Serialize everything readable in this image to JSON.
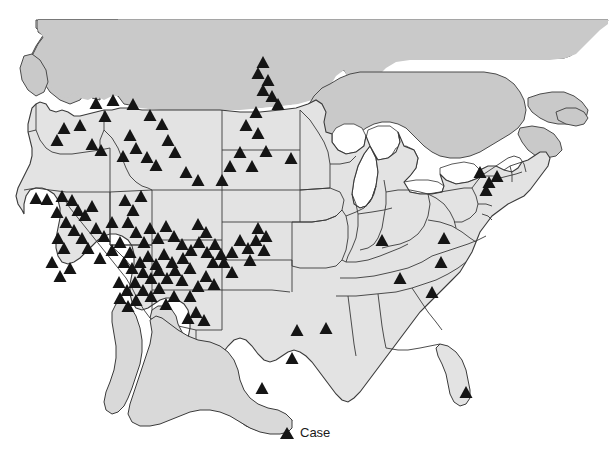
{
  "figure": {
    "title": "",
    "type": "choropleth-point-map",
    "region": "United States (contiguous) with southern Canada and northern Mexico"
  },
  "legend": {
    "marker_icon": "triangle-marker-icon",
    "label": "Case",
    "marker_color": "#151515"
  },
  "colors": {
    "us_fill": "#e3e3e3",
    "canada_fill": "#c9c9c9",
    "mexico_fill": "#d9d9d9",
    "border_stroke": "#3a3a3a",
    "water": "#ffffff",
    "marker": "#151515",
    "background": "#ffffff"
  },
  "map_data": {
    "type": "point-map",
    "marker_symbol": "triangle",
    "marker_size_px": 13,
    "total_markers": 152,
    "clusters": [
      {
        "name": "Pacific Northwest (WA/OR/ID)",
        "count": 14
      },
      {
        "name": "Sierra Nevada / CA-NV border",
        "count": 26
      },
      {
        "name": "Montana / Wyoming",
        "count": 10
      },
      {
        "name": "Dakotas diagonal",
        "count": 7
      },
      {
        "name": "Four Corners (CO/NM/UT/AZ)",
        "count": 52
      },
      {
        "name": "Texas / Gulf Coast",
        "count": 6
      },
      {
        "name": "Midwest / Ohio Valley",
        "count": 4
      },
      {
        "name": "Northeast corridor (NY/CT/NJ)",
        "count": 4
      },
      {
        "name": "Southeast (NC/FL)",
        "count": 2
      }
    ],
    "markers": [
      [
        263,
        62
      ],
      [
        258,
        73
      ],
      [
        268,
        80
      ],
      [
        263,
        90
      ],
      [
        272,
        96
      ],
      [
        278,
        104
      ],
      [
        256,
        112
      ],
      [
        96,
        103
      ],
      [
        113,
        100
      ],
      [
        133,
        104
      ],
      [
        150,
        115
      ],
      [
        162,
        124
      ],
      [
        105,
        116
      ],
      [
        80,
        125
      ],
      [
        64,
        128
      ],
      [
        57,
        140
      ],
      [
        92,
        144
      ],
      [
        101,
        150
      ],
      [
        130,
        135
      ],
      [
        136,
        148
      ],
      [
        168,
        140
      ],
      [
        123,
        156
      ],
      [
        147,
        157
      ],
      [
        156,
        165
      ],
      [
        175,
        152
      ],
      [
        246,
        125
      ],
      [
        258,
        133
      ],
      [
        240,
        152
      ],
      [
        266,
        151
      ],
      [
        252,
        166
      ],
      [
        291,
        158
      ],
      [
        230,
        166
      ],
      [
        222,
        180
      ],
      [
        186,
        172
      ],
      [
        198,
        180
      ],
      [
        36,
        198
      ],
      [
        47,
        199
      ],
      [
        62,
        196
      ],
      [
        72,
        200
      ],
      [
        78,
        210
      ],
      [
        85,
        215
      ],
      [
        92,
        206
      ],
      [
        57,
        212
      ],
      [
        66,
        222
      ],
      [
        74,
        230
      ],
      [
        82,
        238
      ],
      [
        96,
        228
      ],
      [
        104,
        236
      ],
      [
        112,
        222
      ],
      [
        88,
        248
      ],
      [
        100,
        258
      ],
      [
        58,
        238
      ],
      [
        64,
        248
      ],
      [
        52,
        262
      ],
      [
        70,
        268
      ],
      [
        60,
        276
      ],
      [
        125,
        200
      ],
      [
        133,
        210
      ],
      [
        141,
        196
      ],
      [
        128,
        222
      ],
      [
        136,
        232
      ],
      [
        144,
        242
      ],
      [
        120,
        242
      ],
      [
        112,
        250
      ],
      [
        130,
        252
      ],
      [
        150,
        228
      ],
      [
        158,
        238
      ],
      [
        166,
        226
      ],
      [
        174,
        236
      ],
      [
        182,
        244
      ],
      [
        140,
        262
      ],
      [
        148,
        256
      ],
      [
        156,
        264
      ],
      [
        132,
        268
      ],
      [
        124,
        262
      ],
      [
        164,
        254
      ],
      [
        172,
        262
      ],
      [
        143,
        272
      ],
      [
        151,
        278
      ],
      [
        159,
        270
      ],
      [
        135,
        282
      ],
      [
        127,
        290
      ],
      [
        119,
        282
      ],
      [
        167,
        278
      ],
      [
        143,
        290
      ],
      [
        151,
        296
      ],
      [
        136,
        300
      ],
      [
        128,
        306
      ],
      [
        120,
        298
      ],
      [
        159,
        288
      ],
      [
        175,
        270
      ],
      [
        183,
        258
      ],
      [
        191,
        250
      ],
      [
        199,
        242
      ],
      [
        207,
        252
      ],
      [
        215,
        244
      ],
      [
        206,
        232
      ],
      [
        198,
        224
      ],
      [
        213,
        262
      ],
      [
        221,
        254
      ],
      [
        190,
        268
      ],
      [
        182,
        280
      ],
      [
        198,
        286
      ],
      [
        206,
        276
      ],
      [
        214,
        284
      ],
      [
        190,
        296
      ],
      [
        174,
        296
      ],
      [
        166,
        304
      ],
      [
        240,
        240
      ],
      [
        248,
        248
      ],
      [
        256,
        240
      ],
      [
        264,
        250
      ],
      [
        250,
        260
      ],
      [
        232,
        252
      ],
      [
        258,
        228
      ],
      [
        266,
        236
      ],
      [
        224,
        262
      ],
      [
        232,
        272
      ],
      [
        196,
        312
      ],
      [
        204,
        320
      ],
      [
        188,
        318
      ],
      [
        262,
        388
      ],
      [
        297,
        330
      ],
      [
        326,
        328
      ],
      [
        292,
        358
      ],
      [
        382,
        240
      ],
      [
        444,
        238
      ],
      [
        441,
        262
      ],
      [
        400,
        278
      ],
      [
        480,
        172
      ],
      [
        489,
        182
      ],
      [
        497,
        176
      ],
      [
        486,
        190
      ],
      [
        432,
        292
      ],
      [
        466,
        392
      ]
    ]
  }
}
